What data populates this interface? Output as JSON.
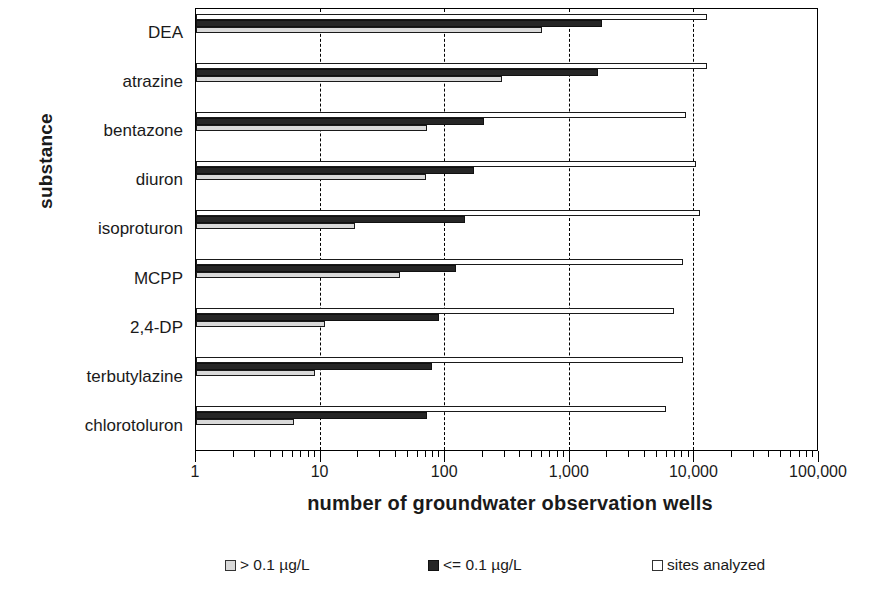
{
  "chart_data": {
    "type": "bar",
    "orientation": "horizontal",
    "title": "",
    "xlabel": "number of groundwater observation wells",
    "ylabel": "substance",
    "xscale": "log",
    "xlim": [
      1,
      100000
    ],
    "xticks": [
      1,
      10,
      100,
      1000,
      10000,
      100000
    ],
    "xticklabels": [
      "1",
      "10",
      "100",
      "1,000",
      "10,000",
      "100,000"
    ],
    "grid": "vertical-dashed-at-decades",
    "legend_position": "bottom",
    "categories": [
      "DEA",
      "atrazine",
      "bentazone",
      "diuron",
      "isoproturon",
      "MCPP",
      "2,4-DP",
      "terbutylazine",
      "chlorotoluron"
    ],
    "series": [
      {
        "name": "> 0.1 µg/L",
        "color": "#d9d9d9",
        "values": [
          610,
          290,
          73,
          71,
          19,
          44,
          11,
          9,
          6.2
        ]
      },
      {
        "name": "<= 0.1 µg/L",
        "color": "#262626",
        "values": [
          1860,
          1720,
          210,
          172,
          147,
          125,
          90,
          80,
          73
        ]
      },
      {
        "name": "sites analyzed",
        "color": "#ffffff",
        "values": [
          12900,
          12900,
          8800,
          10700,
          11500,
          8300,
          7000,
          8300,
          6100
        ]
      }
    ]
  },
  "axes": {
    "y_title": "substance",
    "x_title": "number of groundwater observation wells"
  },
  "legend": {
    "items": [
      {
        "label": "> 0.1 µg/L",
        "swatch": "light-gray-square"
      },
      {
        "label": "<= 0.1 µg/L",
        "swatch": "black-square"
      },
      {
        "label": "sites analyzed",
        "swatch": "white-square"
      }
    ]
  }
}
